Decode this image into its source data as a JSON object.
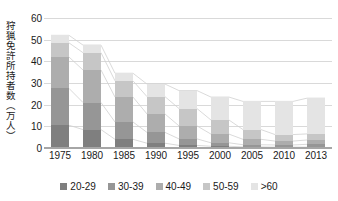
{
  "chart_data": {
    "type": "bar",
    "stacked": true,
    "title": "",
    "xlabel": "",
    "ylabel": "狩猟免許所持者数（万人）",
    "ylim": [
      0,
      60
    ],
    "yticks": [
      0,
      10,
      20,
      30,
      40,
      50,
      60
    ],
    "grid": true,
    "legend_position": "bottom",
    "categories": [
      "1975",
      "1980",
      "1985",
      "1990",
      "1995",
      "2000",
      "2005",
      "2010",
      "2013"
    ],
    "series": [
      {
        "name": "20-29",
        "color": "#7f7f7f",
        "values": [
          10.5,
          8.5,
          4.0,
          2.2,
          1.2,
          0.8,
          0.5,
          0.4,
          0.4
        ]
      },
      {
        "name": "30-39",
        "color": "#969696",
        "values": [
          17.0,
          12.5,
          8.0,
          5.0,
          3.0,
          1.6,
          1.0,
          1.0,
          1.3
        ]
      },
      {
        "name": "40-49",
        "color": "#adadad",
        "values": [
          14.5,
          15.0,
          11.5,
          8.5,
          6.0,
          4.0,
          2.5,
          1.8,
          2.0
        ]
      },
      {
        "name": "50-59",
        "color": "#c6c6c6",
        "values": [
          6.5,
          8.0,
          7.5,
          8.0,
          8.0,
          6.5,
          4.5,
          3.0,
          2.8
        ]
      },
      {
        "name": ">60",
        "color": "#e4e4e4",
        "values": [
          3.5,
          3.5,
          3.5,
          5.8,
          8.3,
          10.6,
          13.0,
          15.3,
          16.5
        ]
      }
    ],
    "totals": [
      52.0,
      47.5,
      34.5,
      29.5,
      26.5,
      23.5,
      21.5,
      21.5,
      23.0
    ],
    "connector_lines": true,
    "connector_color": "#d0d0d0"
  },
  "legend": {
    "items": [
      {
        "label": "20-29",
        "color": "#7f7f7f"
      },
      {
        "label": "30-39",
        "color": "#969696"
      },
      {
        "label": "40-49",
        "color": "#adadad"
      },
      {
        "label": "50-59",
        "color": "#c6c6c6"
      },
      {
        "label": ">60",
        "color": "#e4e4e4"
      }
    ]
  },
  "axis": {
    "y_title": "狩猟免許所持者数（万人）",
    "y_tick_labels": [
      "60",
      "50",
      "40",
      "30",
      "20",
      "10",
      "0"
    ],
    "x_tick_labels": [
      "1975",
      "1980",
      "1985",
      "1990",
      "1995",
      "2000",
      "2005",
      "2010",
      "2013"
    ]
  },
  "colors": {
    "gridline": "#d9d9d9",
    "axis": "#a6a6a6",
    "text": "#1a1a1a",
    "background": "#ffffff"
  }
}
